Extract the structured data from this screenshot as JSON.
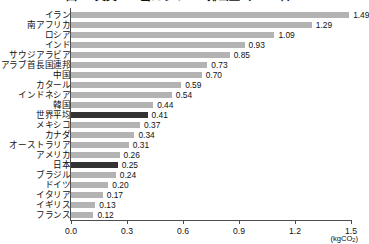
{
  "chart_data": {
    "type": "bar",
    "orientation": "horizontal",
    "title": "図2　実質GDP当たりのCO2排出量（2014年）",
    "xlabel": "(kgCO2)",
    "ylabel": "",
    "unit": "(kgCO",
    "unit_sub": "2",
    "unit_tail": ")",
    "xlim": [
      0.0,
      1.5
    ],
    "xticks": [
      "0.0",
      "0.3",
      "0.6",
      "0.9",
      "1.2",
      "1.5"
    ],
    "xtick_values": [
      0.0,
      0.3,
      0.6,
      0.9,
      1.2,
      1.5
    ],
    "grid": false,
    "legend": "none",
    "bar_color": "#b3b3b3",
    "highlight_color": "#333333",
    "categories": [
      "イラン",
      "南アフリカ",
      "ロシア",
      "インド",
      "サウジアラビア",
      "アラブ首長国連邦",
      "中国",
      "カタール",
      "インドネシア",
      "韓国",
      "世界平均",
      "メキシコ",
      "カナダ",
      "オーストラリア",
      "アメリカ",
      "日本",
      "ブラジル",
      "ドイツ",
      "イタリア",
      "イギリス",
      "フランス"
    ],
    "values": [
      1.49,
      1.29,
      1.09,
      0.93,
      0.85,
      0.73,
      0.7,
      0.59,
      0.54,
      0.44,
      0.41,
      0.37,
      0.34,
      0.31,
      0.26,
      0.25,
      0.24,
      0.2,
      0.17,
      0.13,
      0.12
    ],
    "value_labels": [
      "1.49",
      "1.29",
      "1.09",
      "0.93",
      "0.85",
      "0.73",
      "0.70",
      "0.59",
      "0.54",
      "0.44",
      "0.41",
      "0.37",
      "0.34",
      "0.31",
      "0.26",
      "0.25",
      "0.24",
      "0.20",
      "0.17",
      "0.13",
      "0.12"
    ],
    "highlighted": [
      "世界平均",
      "日本"
    ]
  }
}
